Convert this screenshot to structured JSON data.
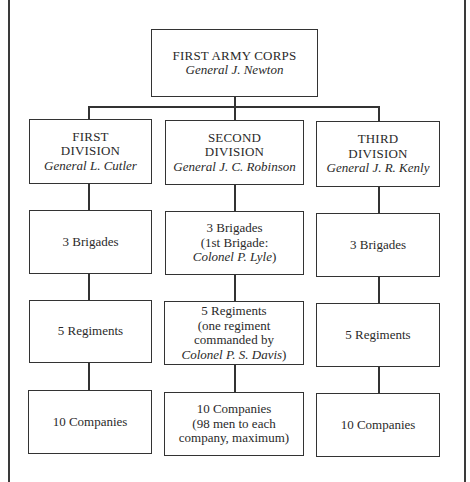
{
  "corps": {
    "title": "FIRST ARMY CORPS",
    "commander": "General J. Newton"
  },
  "divisions": [
    {
      "title_line1": "FIRST",
      "title_line2": "DIVISION",
      "commander": "General L. Cutler",
      "brigades": {
        "line1": "3 Brigades"
      },
      "regiments": {
        "line1": "5 Regiments"
      },
      "companies": {
        "line1": "10 Companies"
      }
    },
    {
      "title_line1": "SECOND",
      "title_line2": "DIVISION",
      "commander": "General J. C. Robinson",
      "brigades": {
        "line1": "3 Brigades",
        "line2": "(1st Brigade:",
        "line3": "Colonel P. Lyle",
        "line3_suffix": ")"
      },
      "regiments": {
        "line1": "5 Regiments",
        "line2": "(one regiment",
        "line3": "commanded by",
        "line4": "Colonel P. S. Davis",
        "line4_suffix": ")"
      },
      "companies": {
        "line1": "10 Companies",
        "line2": "(98 men to each",
        "line3": "company, maximum)"
      }
    },
    {
      "title_line1": "THIRD",
      "title_line2": "DIVISION",
      "commander": "General J. R. Kenly",
      "brigades": {
        "line1": "3 Brigades"
      },
      "regiments": {
        "line1": "5 Regiments"
      },
      "companies": {
        "line1": "10 Companies"
      }
    }
  ]
}
